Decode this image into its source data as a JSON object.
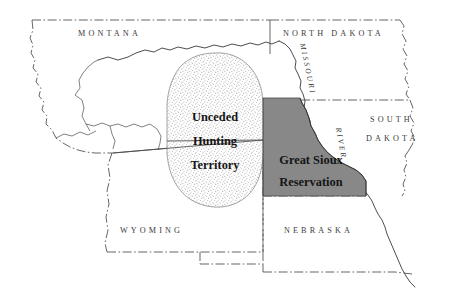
{
  "map": {
    "title": "Great Sioux Reservation and Unceded Hunting Territory",
    "background_color": "#ffffff",
    "border_color": "#4a4a4a",
    "reservation_fill": "#888888",
    "unceded_fill": "#ffffff",
    "label_color": "#3b3b3b"
  },
  "states": [
    {
      "id": "montana",
      "label": "MONTANA"
    },
    {
      "id": "north-dakota",
      "label": "NORTH DAKOTA"
    },
    {
      "id": "south-dakota-line1",
      "label": "SOUTH"
    },
    {
      "id": "south-dakota-line2",
      "label": "DAKOTA"
    },
    {
      "id": "wyoming",
      "label": "WYOMING"
    },
    {
      "id": "nebraska",
      "label": "NEBRASKA"
    }
  ],
  "regions": [
    {
      "id": "unceded-hunting-territory",
      "lines": [
        "Unceded",
        "Hunting",
        "Territory"
      ],
      "fill": "stipple"
    },
    {
      "id": "great-sioux-reservation",
      "lines": [
        "Great Sioux",
        "Reservation"
      ],
      "fill": "#888888"
    }
  ],
  "rivers": [
    {
      "id": "missouri-river",
      "name": "MISSOURI",
      "suffix": "RIVER"
    }
  ]
}
